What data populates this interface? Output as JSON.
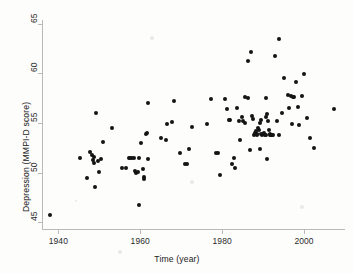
{
  "chart_data": {
    "type": "scatter",
    "title": "",
    "xlabel": "Time (year)",
    "ylabel": "Depression (MMPI-D score)",
    "xlim": [
      1936,
      2010
    ],
    "ylim": [
      44.2,
      65.4
    ],
    "xticks": [
      1940,
      1960,
      1980,
      2000
    ],
    "yticks": [
      45,
      50,
      55,
      60,
      65
    ],
    "xticklabels": [
      "1940",
      "1960",
      "1980",
      "2000"
    ],
    "yticklabels": [
      "45",
      "50",
      "55",
      "60",
      "65"
    ],
    "grid": false,
    "legend": null,
    "marker": {
      "shape": "circle",
      "color": "#141414",
      "size_px": 4,
      "filled": true
    },
    "series": [
      {
        "name": "MMPI-D score by year",
        "points": [
          [
            1938.0,
            45.7
          ],
          [
            1945.2,
            51.5
          ],
          [
            1947.0,
            49.4
          ],
          [
            1947.8,
            52.1
          ],
          [
            1948.2,
            51.8
          ],
          [
            1948.4,
            51.3
          ],
          [
            1948.6,
            51.0
          ],
          [
            1948.8,
            51.6
          ],
          [
            1949.0,
            48.5
          ],
          [
            1949.2,
            56.0
          ],
          [
            1949.6,
            51.2
          ],
          [
            1950.0,
            50.1
          ],
          [
            1950.4,
            51.4
          ],
          [
            1951.0,
            53.1
          ],
          [
            1953.2,
            54.5
          ],
          [
            1955.6,
            50.5
          ],
          [
            1956.4,
            50.5
          ],
          [
            1957.2,
            51.5
          ],
          [
            1957.6,
            51.5
          ],
          [
            1958.0,
            51.5
          ],
          [
            1958.4,
            51.5
          ],
          [
            1958.8,
            50.2
          ],
          [
            1959.0,
            50.0
          ],
          [
            1959.4,
            50.1
          ],
          [
            1959.6,
            51.5
          ],
          [
            1959.8,
            46.7
          ],
          [
            1960.2,
            53.0
          ],
          [
            1960.6,
            50.4
          ],
          [
            1960.8,
            49.3
          ],
          [
            1961.0,
            49.6
          ],
          [
            1961.4,
            53.9
          ],
          [
            1961.6,
            54.0
          ],
          [
            1961.8,
            51.4
          ],
          [
            1962.0,
            57.0
          ],
          [
            1965.0,
            53.5
          ],
          [
            1966.2,
            53.3
          ],
          [
            1966.6,
            54.9
          ],
          [
            1967.8,
            55.1
          ],
          [
            1968.2,
            57.2
          ],
          [
            1971.0,
            50.9
          ],
          [
            1971.4,
            50.9
          ],
          [
            1972.0,
            52.4
          ],
          [
            1972.6,
            54.6
          ],
          [
            1976.4,
            54.9
          ],
          [
            1977.2,
            57.4
          ],
          [
            1978.6,
            52.0
          ],
          [
            1979.0,
            52.0
          ],
          [
            1979.4,
            49.8
          ],
          [
            1980.6,
            57.4
          ],
          [
            1981.2,
            56.4
          ],
          [
            1981.6,
            55.3
          ],
          [
            1982.0,
            55.3
          ],
          [
            1982.4,
            50.9
          ],
          [
            1982.8,
            51.5
          ],
          [
            1983.2,
            50.5
          ],
          [
            1983.6,
            56.5
          ],
          [
            1984.8,
            55.6
          ],
          [
            1985.6,
            55.0
          ],
          [
            1986.4,
            57.5
          ],
          [
            1986.8,
            52.3
          ],
          [
            1987.2,
            55.7
          ],
          [
            1987.6,
            55.4
          ],
          [
            1987.8,
            53.8
          ],
          [
            1988.0,
            54.0
          ],
          [
            1988.2,
            54.2
          ],
          [
            1988.4,
            53.9
          ],
          [
            1988.6,
            53.8
          ],
          [
            1988.8,
            54.5
          ],
          [
            1989.0,
            54.3
          ],
          [
            1989.2,
            55.0
          ],
          [
            1989.4,
            55.3
          ],
          [
            1989.6,
            53.9
          ],
          [
            1989.8,
            53.8
          ],
          [
            1990.0,
            53.9
          ],
          [
            1990.2,
            54.0
          ],
          [
            1990.4,
            53.8
          ],
          [
            1990.6,
            53.8
          ],
          [
            1990.8,
            55.6
          ],
          [
            1991.0,
            55.9
          ],
          [
            1991.2,
            55.2
          ],
          [
            1991.4,
            54.3
          ],
          [
            1991.6,
            53.9
          ],
          [
            1991.8,
            53.8
          ],
          [
            1992.0,
            53.8
          ],
          [
            1992.2,
            53.8
          ],
          [
            1992.4,
            53.8
          ],
          [
            1986.2,
            61.3
          ],
          [
            1987.0,
            62.2
          ],
          [
            1985.6,
            57.6
          ],
          [
            1990.6,
            57.5
          ],
          [
            1991.0,
            51.4
          ],
          [
            1989.2,
            52.4
          ],
          [
            1992.8,
            61.8
          ],
          [
            1994.0,
            63.5
          ],
          [
            1994.6,
            56.0
          ],
          [
            1995.2,
            59.5
          ],
          [
            1996.0,
            57.8
          ],
          [
            1996.4,
            56.5
          ],
          [
            1996.8,
            57.7
          ],
          [
            1997.2,
            57.6
          ],
          [
            1997.6,
            57.6
          ],
          [
            1997.0,
            54.9
          ],
          [
            1998.0,
            59.1
          ],
          [
            1998.4,
            56.6
          ],
          [
            1998.8,
            54.8
          ],
          [
            1999.6,
            57.7
          ],
          [
            2000.0,
            59.9
          ],
          [
            2000.8,
            55.5
          ],
          [
            2001.4,
            53.5
          ],
          [
            2002.4,
            52.5
          ],
          [
            2007.2,
            56.4
          ],
          [
            1984.0,
            55.2
          ],
          [
            1985.0,
            55.2
          ],
          [
            1993.4,
            55.2
          ],
          [
            1993.8,
            53.8
          ],
          [
            1984.4,
            53.3
          ],
          [
            1969.6,
            52.0
          ]
        ]
      }
    ]
  },
  "axes": {
    "x_tick_positions_px": [
      50,
      126,
      202,
      277
    ],
    "y_tick_positions_px": [
      228,
      176,
      125,
      73,
      22
    ]
  }
}
